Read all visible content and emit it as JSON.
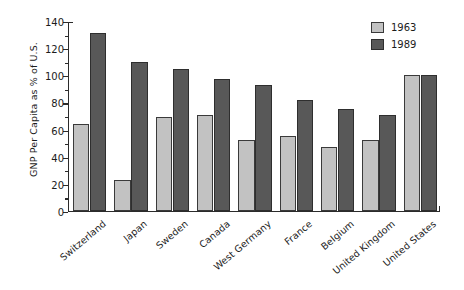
{
  "chart_data": {
    "type": "bar",
    "title": "",
    "xlabel": "",
    "ylabel": "GNP Per Capita as % of U.S.",
    "ylim": [
      0,
      140
    ],
    "ytick_step": 20,
    "yticks": [
      0,
      20,
      40,
      60,
      80,
      100,
      120,
      140
    ],
    "ytick_labels": [
      "0",
      "20",
      "40",
      "60",
      "80",
      "100",
      "120",
      "140"
    ],
    "grid": false,
    "legend_position": "top-right",
    "categories": [
      "Switzerland",
      "Japan",
      "Sweden",
      "Canada",
      "West Germany",
      "France",
      "Belgium",
      "United Kingdom",
      "United States"
    ],
    "series": [
      {
        "name": "1963",
        "color": "#c2c2c2",
        "values": [
          64,
          23,
          69,
          71,
          52,
          55,
          47,
          52,
          100
        ]
      },
      {
        "name": "1989",
        "color": "#585858",
        "values": [
          131,
          110,
          105,
          97,
          93,
          82,
          75,
          71,
          100
        ]
      }
    ]
  },
  "legend": {
    "items": [
      {
        "label": "1963",
        "series_key": "s1963"
      },
      {
        "label": "1989",
        "series_key": "s1989"
      }
    ]
  }
}
